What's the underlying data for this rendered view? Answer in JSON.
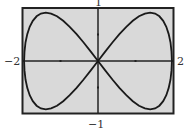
{
  "chart_data": {
    "type": "line",
    "title": "",
    "xlabel": "",
    "ylabel": "",
    "xlim": [
      -2,
      2
    ],
    "ylim": [
      -1,
      1
    ],
    "grid": false,
    "x_ticks": [
      -1,
      1
    ],
    "y_ticks": [
      -0.5,
      0.5
    ],
    "series": [
      {
        "name": "curve",
        "param": "t",
        "x_expr": "2 sin t",
        "y_expr": "sin 2t",
        "x": [
          0,
          0.77,
          1.41,
          1.85,
          2,
          1.85,
          1.41,
          0.77,
          0,
          -0.77,
          -1.41,
          -1.85,
          -2,
          -1.85,
          -1.41,
          -0.77,
          0
        ],
        "y": [
          0,
          0.71,
          1,
          0.71,
          0,
          -0.71,
          -1,
          -0.71,
          0,
          0.71,
          1,
          0.71,
          0,
          -0.71,
          -1,
          -0.71,
          0
        ]
      }
    ]
  },
  "labels": {
    "top": "1",
    "bottom": "−1",
    "left": "−2",
    "right": "2"
  },
  "colors": {
    "screen_bg": "#d9d9d9",
    "frame": "#222222",
    "curve": "#1a1a1a"
  }
}
